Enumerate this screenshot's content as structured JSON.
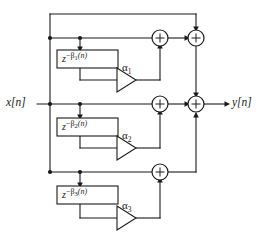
{
  "figure": {
    "type": "signal-flow-block-diagram",
    "title": "",
    "background_color": "#ffffff",
    "line_color": "#1a1a1a"
  },
  "io": {
    "input_label": "x[n]",
    "output_label": "y[n]"
  },
  "branches": [
    {
      "index": 1,
      "delay_label": {
        "base": "z",
        "minus": "−",
        "beta": "β",
        "subscript": "1",
        "arg": "(n)",
        "full": "z⁻β₁(n)"
      },
      "gain_label": {
        "symbol": "α",
        "subscript": "1",
        "full": "α₁"
      }
    },
    {
      "index": 2,
      "delay_label": {
        "base": "z",
        "minus": "−",
        "beta": "β",
        "subscript": "2",
        "arg": "(n)",
        "full": "z⁻β₂(n)"
      },
      "gain_label": {
        "symbol": "α",
        "subscript": "2",
        "full": "α₂"
      }
    },
    {
      "index": 3,
      "delay_label": {
        "base": "z",
        "minus": "−",
        "beta": "β",
        "subscript": "3",
        "arg": "(n)",
        "full": "z⁻β₃(n)"
      },
      "gain_label": {
        "symbol": "α",
        "subscript": "3",
        "full": "α₃"
      }
    }
  ],
  "adders": [
    {
      "name": "adder-branch-1",
      "symbol": "+"
    },
    {
      "name": "adder-sum-top",
      "symbol": "+"
    },
    {
      "name": "adder-branch-2",
      "symbol": "+"
    },
    {
      "name": "adder-output",
      "symbol": "+"
    },
    {
      "name": "adder-branch-3",
      "symbol": "+"
    }
  ]
}
